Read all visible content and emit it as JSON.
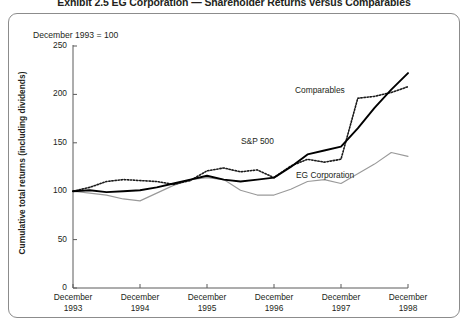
{
  "exhibit": {
    "title": "Exhibit 2.5   EG Corporation — Shareholder Returns versus Comparables",
    "baseline_note": "December 1993 = 100"
  },
  "chart_data": {
    "type": "line",
    "title": "EG Corporation — Shareholder Returns versus Comparables",
    "subtitle": "December 1993 = 100",
    "xlabel": "",
    "ylabel": "Cumulative total returns (including dividends)",
    "ylim": [
      0,
      250
    ],
    "yticks": [
      0,
      50,
      100,
      150,
      200,
      250
    ],
    "ytick_labels": [
      "0",
      "50",
      "100",
      "150",
      "200",
      "250"
    ],
    "grid": false,
    "legend_position": "inline-annotations",
    "xtick_labels": [
      [
        "December",
        "1993"
      ],
      [
        "December",
        "1994"
      ],
      [
        "December",
        "1995"
      ],
      [
        "December",
        "1996"
      ],
      [
        "December",
        "1997"
      ],
      [
        "December",
        "1998"
      ]
    ],
    "x": [
      "Dec 1993",
      "Mar 1994",
      "Jun 1994",
      "Sep 1994",
      "Dec 1994",
      "Mar 1995",
      "Jun 1995",
      "Sep 1995",
      "Dec 1995",
      "Mar 1996",
      "Jun 1996",
      "Sep 1996",
      "Dec 1996",
      "Mar 1997",
      "Jun 1997",
      "Sep 1997",
      "Dec 1997",
      "Mar 1998",
      "Jun 1998",
      "Sep 1998",
      "Dec 1998"
    ],
    "series": [
      {
        "name": "S&P 500",
        "style": "solid-black-thick",
        "color": "#000000",
        "label_x_index": 12,
        "values": [
          100,
          101,
          99,
          100,
          101,
          104,
          108,
          112,
          116,
          112,
          110,
          112,
          114,
          125,
          138,
          142,
          146,
          165,
          186,
          205,
          222
        ]
      },
      {
        "name": "Comparables",
        "style": "dotted-black",
        "color": "#1a1a1a",
        "label_x_index": 14,
        "values": [
          100,
          104,
          110,
          112,
          111,
          110,
          107,
          111,
          121,
          124,
          120,
          122,
          114,
          126,
          133,
          130,
          133,
          196,
          198,
          202,
          208
        ]
      },
      {
        "name": "EG Corporation",
        "style": "solid-gray-thin",
        "color": "#999999",
        "label_x_index": 13,
        "values": [
          100,
          98,
          96,
          92,
          90,
          98,
          106,
          112,
          114,
          112,
          101,
          96,
          96,
          102,
          110,
          112,
          108,
          118,
          128,
          140,
          136
        ]
      }
    ],
    "annotations": [
      {
        "text": "Comparables",
        "x_px": 295,
        "y_px": 85
      },
      {
        "text": "S&P 500",
        "x_px": 241,
        "y_px": 136
      },
      {
        "text": "EG Corporation",
        "x_px": 296,
        "y_px": 170
      }
    ]
  }
}
